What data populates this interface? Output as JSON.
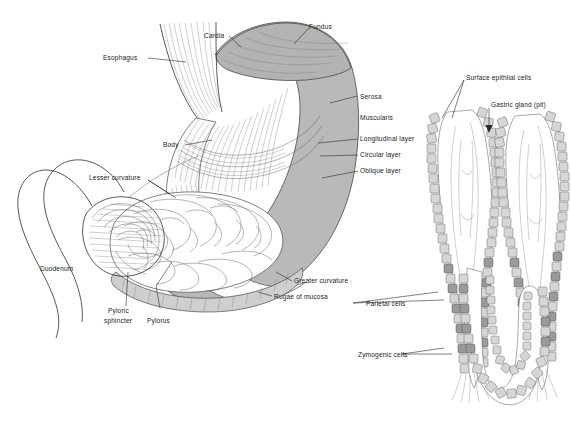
{
  "figure": {
    "background_color": "#ffffff",
    "ink_color": "#1b1b1b",
    "shading_color": "#b9b9b9"
  },
  "panels": [
    {
      "id": "stomach-panel",
      "name": "stomach-gross-anatomy",
      "labels": [
        {
          "key": "esophagus",
          "text": "Esophagus"
        },
        {
          "key": "cardia",
          "text": "Cardia"
        },
        {
          "key": "fundus",
          "text": "Fundus"
        },
        {
          "key": "serosa",
          "text": "Serosa"
        },
        {
          "key": "muscularis",
          "text": "Muscularis"
        },
        {
          "key": "longitudinal_layer",
          "text": "Longitudinal layer"
        },
        {
          "key": "circular_layer",
          "text": "Circular layer"
        },
        {
          "key": "oblique_layer",
          "text": "Oblique layer"
        },
        {
          "key": "body",
          "text": "Body"
        },
        {
          "key": "lesser_curvature",
          "text": "Lesser curvature"
        },
        {
          "key": "duodenum",
          "text": "Duodenum"
        },
        {
          "key": "pyloric_sphincter_1",
          "text": "Pyloric"
        },
        {
          "key": "pyloric_sphincter_2",
          "text": "sphincter"
        },
        {
          "key": "pylorus",
          "text": "Pylorus"
        },
        {
          "key": "rugae_of_mucosa",
          "text": "Rugae of mucosa"
        },
        {
          "key": "greater_curvature",
          "text": "Greater curvature"
        }
      ]
    },
    {
      "id": "gland-panel",
      "name": "gastric-gland-histology",
      "labels": [
        {
          "key": "surface_epithelial_cells",
          "text": "Surface epithlial cells"
        },
        {
          "key": "gastric_gland_pit",
          "text": "Gastric gland (pit)"
        },
        {
          "key": "parietal_cells",
          "text": "Parietal cells"
        },
        {
          "key": "zymogenic_cells",
          "text": "Zymogenic cells"
        }
      ]
    }
  ],
  "label_text": {
    "esophagus": "Esophagus",
    "cardia": "Cardia",
    "fundus": "Fundus",
    "serosa": "Serosa",
    "muscularis": "Muscularis",
    "longitudinal_layer": "Longitudinal layer",
    "circular_layer": "Circular layer",
    "oblique_layer": "Oblique layer",
    "body": "Body",
    "lesser_curvature": "Lesser curvature",
    "duodenum": "Duodenum",
    "pyloric_line1": "Pyloric",
    "pyloric_line2": "sphincter",
    "pylorus": "Pylorus",
    "rugae_of_mucosa": "Rugae of mucosa",
    "greater_curvature": "Greater curvature",
    "surface_epithelial_cells": "Surface epithlial cells",
    "gastric_gland_pit": "Gastric gland (pit)",
    "parietal_cells": "Parietal cells",
    "zymogenic_cells": "Zymogenic cells"
  }
}
